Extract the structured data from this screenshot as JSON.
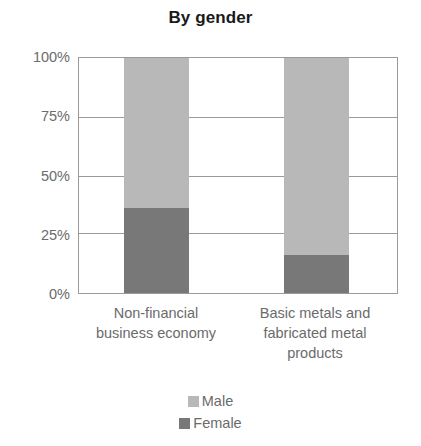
{
  "chart_data": {
    "type": "bar",
    "subtype": "stacked-100-percent",
    "title": "By gender",
    "xlabel": "",
    "ylabel": "",
    "categories": [
      "Non-financial business economy",
      "Basic metals and fabricated metal products"
    ],
    "category_lines": [
      [
        "Non-financial",
        "business economy"
      ],
      [
        "Basic metals and",
        "fabricated metal",
        "products"
      ]
    ],
    "series": [
      {
        "name": "Male",
        "values": [
          64,
          84
        ],
        "color": "#b8b8b8"
      },
      {
        "name": "Female",
        "values": [
          36,
          16
        ],
        "color": "#787878"
      }
    ],
    "stack_order_bottom_to_top": [
      "Female",
      "Male"
    ],
    "ylim": [
      0,
      100
    ],
    "yticks": [
      0,
      25,
      50,
      75,
      100
    ],
    "ytick_labels": [
      "0%",
      "25%",
      "50%",
      "75%",
      "100%"
    ],
    "grid": true,
    "grid_axis": "y",
    "legend_position": "bottom",
    "legend_entries": [
      {
        "label": "Male",
        "color": "#b8b8b8"
      },
      {
        "label": "Female",
        "color": "#787878"
      }
    ],
    "axis_color": "#9a9a9a",
    "text_color": "#6b6b6b",
    "title_color": "#1a1a1a",
    "background": "#ffffff"
  }
}
